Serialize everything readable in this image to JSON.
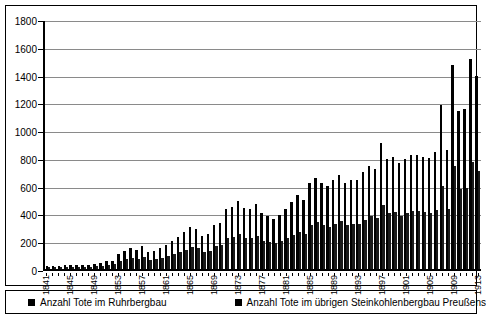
{
  "chart_data": {
    "type": "bar",
    "title": "",
    "xlabel": "",
    "ylabel": "",
    "ylim": [
      0,
      1800
    ],
    "ytick_step": 200,
    "yticks": [
      0,
      200,
      400,
      600,
      800,
      1000,
      1200,
      1400,
      1600,
      1800
    ],
    "grid": true,
    "legend_position": "bottom",
    "bar_layout": "grouped",
    "xtick_label_interval": 4,
    "xtick_label_rotation": -90,
    "categories": [
      "1841",
      "1842",
      "1843",
      "1844",
      "1845",
      "1846",
      "1847",
      "1848",
      "1849",
      "1850",
      "1851",
      "1852",
      "1853",
      "1854",
      "1855",
      "1856",
      "1857",
      "1858",
      "1859",
      "1860",
      "1861",
      "1862",
      "1863",
      "1864",
      "1865",
      "1866",
      "1867",
      "1868",
      "1869",
      "1870",
      "1871",
      "1872",
      "1873",
      "1874",
      "1875",
      "1876",
      "1877",
      "1878",
      "1879",
      "1880",
      "1881",
      "1882",
      "1883",
      "1884",
      "1885",
      "1886",
      "1887",
      "1888",
      "1889",
      "1890",
      "1891",
      "1892",
      "1893",
      "1894",
      "1895",
      "1896",
      "1897",
      "1898",
      "1899",
      "1900",
      "1901",
      "1902",
      "1903",
      "1904",
      "1905",
      "1906",
      "1907",
      "1908",
      "1909",
      "1910",
      "1911",
      "1912",
      "1913"
    ],
    "visible_tick_labels": [
      "1841",
      "1845",
      "1849",
      "1853",
      "1857",
      "1861",
      "1865",
      "1869",
      "1873",
      "1877",
      "1881",
      "1885",
      "1889",
      "1893",
      "1897",
      "1901",
      "1905",
      "1909",
      "1913"
    ],
    "series": [
      {
        "name": "Anzahl Tote im Ruhrbergbau",
        "color": "#000000",
        "values": [
          20,
          25,
          22,
          28,
          30,
          32,
          30,
          26,
          35,
          45,
          55,
          60,
          110,
          130,
          150,
          140,
          165,
          120,
          130,
          150,
          175,
          200,
          230,
          270,
          300,
          290,
          240,
          250,
          320,
          330,
          430,
          445,
          490,
          440,
          430,
          470,
          400,
          380,
          360,
          390,
          430,
          480,
          530,
          500,
          620,
          655,
          620,
          600,
          640,
          680,
          620,
          640,
          640,
          700,
          745,
          720,
          905,
          790,
          805,
          760,
          795,
          820,
          820,
          810,
          800,
          840,
          1180,
          855,
          1470,
          1135,
          1150,
          1510,
          1390
        ]
      },
      {
        "name": "Anzahl Tote im übrigen Steinkohlenbergbau Preußens",
        "color": "#1a1a1a",
        "values": [
          12,
          14,
          13,
          15,
          16,
          18,
          17,
          14,
          19,
          24,
          30,
          33,
          55,
          70,
          80,
          75,
          88,
          65,
          70,
          80,
          95,
          105,
          120,
          140,
          155,
          150,
          125,
          130,
          165,
          170,
          220,
          230,
          250,
          225,
          220,
          240,
          205,
          195,
          185,
          200,
          220,
          245,
          270,
          255,
          315,
          335,
          315,
          305,
          325,
          345,
          315,
          325,
          325,
          355,
          380,
          365,
          460,
          400,
          410,
          385,
          405,
          415,
          415,
          410,
          405,
          425,
          600,
          435,
          745,
          575,
          585,
          770,
          705
        ]
      }
    ]
  },
  "legend": {
    "items": [
      {
        "label": "Anzahl Tote im Ruhrbergbau",
        "swatch_color": "#000000"
      },
      {
        "label": "Anzahl Tote im übrigen Steinkohlenbergbau Preußens",
        "swatch_color": "#000000"
      }
    ]
  }
}
